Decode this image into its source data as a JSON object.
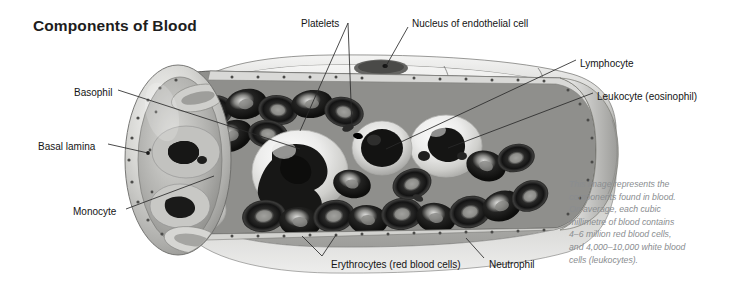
{
  "figure": {
    "title": "Components of Blood",
    "type": "anatomical-illustration",
    "style": "grayscale airbrush medical illustration",
    "background_color": "#ffffff",
    "title_color": "#1d1d1d",
    "label_color": "#141414",
    "caption_color": "#8a8d90",
    "leader_line_color": "#2b2b2b"
  },
  "labels": [
    {
      "id": "platelets",
      "text": "Platelets",
      "x": 301,
      "y": 18,
      "align": "left"
    },
    {
      "id": "nucleus",
      "text": "Nucleus of endothelial cell",
      "x": 412,
      "y": 18,
      "align": "left"
    },
    {
      "id": "lymphocyte",
      "text": "Lymphocyte",
      "x": 580,
      "y": 58,
      "align": "left"
    },
    {
      "id": "leukocyte",
      "text": "Leukocyte (eosinophil)",
      "x": 597,
      "y": 91,
      "align": "left"
    },
    {
      "id": "basophil",
      "text": "Basophil",
      "x": 74,
      "y": 87,
      "align": "left"
    },
    {
      "id": "basal-lamina",
      "text": "Basal lamina",
      "x": 38,
      "y": 141,
      "align": "left"
    },
    {
      "id": "monocyte",
      "text": "Monocyte",
      "x": 73,
      "y": 206,
      "align": "left"
    },
    {
      "id": "erythrocytes",
      "text": "Erythrocytes (red blood cells)",
      "x": 331,
      "y": 259,
      "align": "left"
    },
    {
      "id": "neutrophil",
      "text": "Neutrophil",
      "x": 489,
      "y": 259,
      "align": "left"
    }
  ],
  "caption": {
    "lines": [
      "This image represents the",
      "components found in blood.",
      "On average, each cubic",
      "millimetre of blood contains",
      "4–6 million red blood cells,",
      "and 4,000–10,000 white blood",
      "cells (leukocytes)."
    ]
  },
  "measurements": {
    "red_blood_cells_per_cubic_mm": "4–6 million",
    "white_blood_cells_per_cubic_mm": "4,000–10,000"
  },
  "canvas": {
    "width": 732,
    "height": 297
  }
}
